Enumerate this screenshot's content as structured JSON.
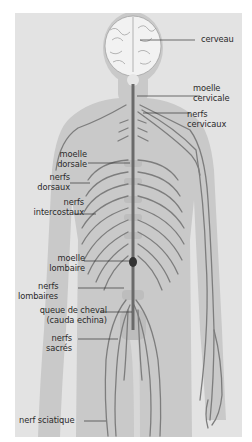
{
  "diagram": {
    "colors": {
      "background": "#ffffff",
      "panel": "#e3e3e3",
      "body_silhouette": "#c9c9c9",
      "nerve": "#7d7d7d",
      "spine": "#6a6a6a",
      "brain": "#f2f2f2",
      "label_text": "#2a2a2a",
      "leader_line": "#333333"
    },
    "labels": {
      "cerveau": {
        "lines": [
          "cerveau"
        ]
      },
      "moelle_cervicale": {
        "lines": [
          "moelle",
          "cervicale"
        ]
      },
      "nerfs_cervicaux": {
        "lines": [
          "nerfs",
          "cervicaux"
        ]
      },
      "moelle_dorsale": {
        "lines": [
          "moelle",
          "dorsale"
        ]
      },
      "nerfs_dorsaux": {
        "lines": [
          "nerfs",
          "dorsaux"
        ]
      },
      "nerfs_intercostaux": {
        "lines": [
          "nerfs",
          "intercostaux"
        ]
      },
      "moelle_lombaire": {
        "lines": [
          "moelle",
          "lombaire"
        ]
      },
      "nerfs_lombaires": {
        "lines": [
          "nerfs",
          "lombaires"
        ]
      },
      "queue_de_cheval": {
        "lines": [
          "queue de cheval",
          "(cauda echina)"
        ]
      },
      "nerfs_sacres": {
        "lines": [
          "nerfs",
          "sacrés"
        ]
      },
      "nerf_sciatique": {
        "lines": [
          "nerf sciatique"
        ]
      }
    }
  }
}
